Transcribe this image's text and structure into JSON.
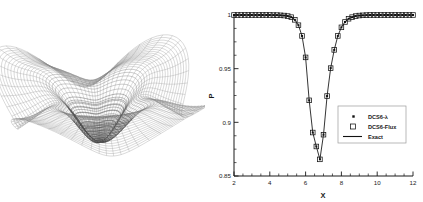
{
  "figure": {
    "panels": [
      "surface-plot",
      "line-plot"
    ]
  },
  "surface_plot": {
    "name": "pressure-surface-wireframe",
    "description": "3D wireframe mesh surface",
    "mesh_color": "#8a8a8a",
    "center_color": "#4a4a4a",
    "radial_lines": 72,
    "circumferential_lines": 34
  },
  "chart_data": {
    "type": "line",
    "title": "",
    "xlabel": "X",
    "ylabel": "P",
    "xlim": [
      2,
      12
    ],
    "ylim": [
      0.85,
      1.0
    ],
    "xticks": [
      "2",
      "4",
      "6",
      "8",
      "10",
      "12"
    ],
    "yticks": [
      "0.85",
      "0.9",
      "0.95",
      "1"
    ],
    "xtick_values": [
      2,
      4,
      6,
      8,
      10,
      12
    ],
    "ytick_values": [
      0.85,
      0.9,
      0.95,
      1.0
    ],
    "grid": false,
    "legend_position": "center-right",
    "legend": [
      {
        "label": "DCS6-λ",
        "marker": "dot"
      },
      {
        "label": "DCS6-Flux",
        "marker": "square"
      },
      {
        "label": "Exact",
        "marker": "line"
      }
    ],
    "series": [
      {
        "name": "Exact",
        "marker": "line",
        "x": [
          2.0,
          2.4,
          2.8,
          3.2,
          3.6,
          4.0,
          4.4,
          4.8,
          5.0,
          5.2,
          5.4,
          5.6,
          5.8,
          6.0,
          6.2,
          6.4,
          6.6,
          6.8,
          7.0,
          7.2,
          7.4,
          7.6,
          7.8,
          8.0,
          8.2,
          8.4,
          8.6,
          8.8,
          9.0,
          9.4,
          9.8,
          10.2,
          10.6,
          11.0,
          11.4,
          11.8,
          12.0
        ],
        "y": [
          1.0,
          1.0,
          1.0,
          1.0,
          1.0,
          1.0,
          0.9999,
          0.9995,
          0.999,
          0.998,
          0.9955,
          0.9905,
          0.9805,
          0.9605,
          0.9205,
          0.8905,
          0.8775,
          0.8655,
          0.8885,
          0.9245,
          0.9505,
          0.9675,
          0.9805,
          0.9885,
          0.9935,
          0.9965,
          0.998,
          0.999,
          0.9995,
          0.9999,
          1.0,
          1.0,
          1.0,
          1.0,
          1.0,
          1.0,
          1.0
        ]
      },
      {
        "name": "DCS6-Flux",
        "marker": "square",
        "x": [
          2.0,
          2.2,
          2.4,
          2.6,
          2.8,
          3.0,
          3.2,
          3.4,
          3.6,
          3.8,
          4.0,
          4.2,
          4.4,
          4.6,
          4.8,
          5.0,
          5.2,
          5.4,
          5.6,
          5.8,
          6.0,
          6.2,
          6.4,
          6.6,
          6.8,
          7.0,
          7.2,
          7.4,
          7.6,
          7.8,
          8.0,
          8.2,
          8.4,
          8.6,
          8.8,
          9.0,
          9.2,
          9.4,
          9.6,
          9.8,
          10.0,
          10.2,
          10.4,
          10.6,
          10.8,
          11.0,
          11.2,
          11.4,
          11.6,
          11.8,
          12.0
        ],
        "y": [
          1.0,
          1.0,
          1.0,
          1.0,
          1.0,
          1.0,
          1.0,
          1.0,
          1.0,
          1.0,
          1.0,
          0.9999,
          0.9999,
          0.9997,
          0.9995,
          0.999,
          0.998,
          0.9955,
          0.9905,
          0.9805,
          0.9605,
          0.9205,
          0.8905,
          0.8775,
          0.8655,
          0.8885,
          0.9245,
          0.9505,
          0.9675,
          0.9805,
          0.9885,
          0.9935,
          0.9965,
          0.998,
          0.999,
          0.9995,
          0.9997,
          0.9999,
          1.0,
          1.0,
          1.0,
          1.0,
          1.0,
          1.0,
          1.0,
          1.0,
          1.0,
          1.0,
          1.0,
          1.0,
          1.0
        ]
      },
      {
        "name": "DCS6-λ",
        "marker": "dot",
        "x": [
          2.0,
          2.2,
          2.4,
          2.6,
          2.8,
          3.0,
          3.2,
          3.4,
          3.6,
          3.8,
          4.0,
          4.2,
          4.4,
          4.6,
          4.8,
          5.0,
          5.2,
          5.4,
          5.6,
          5.8,
          6.0,
          6.2,
          6.4,
          6.6,
          6.8,
          7.0,
          7.2,
          7.4,
          7.6,
          7.8,
          8.0,
          8.2,
          8.4,
          8.6,
          8.8,
          9.0,
          9.2,
          9.4,
          9.6,
          9.8,
          10.0,
          10.2,
          10.4,
          10.6,
          10.8,
          11.0,
          11.2,
          11.4,
          11.6,
          11.8,
          12.0
        ],
        "y": [
          1.0,
          1.0,
          1.0,
          1.0,
          1.0,
          1.0,
          1.0,
          1.0,
          1.0,
          1.0,
          1.0,
          0.9999,
          0.9999,
          0.9997,
          0.9995,
          0.999,
          0.998,
          0.9955,
          0.9905,
          0.9805,
          0.9605,
          0.9205,
          0.8905,
          0.8775,
          0.8655,
          0.8885,
          0.9245,
          0.9505,
          0.9675,
          0.9805,
          0.9885,
          0.9935,
          0.9965,
          0.998,
          0.999,
          0.9995,
          0.9997,
          0.9999,
          1.0,
          1.0,
          1.0,
          1.0,
          1.0,
          1.0,
          1.0,
          1.0,
          1.0,
          1.0,
          1.0,
          1.0,
          1.0
        ]
      }
    ]
  }
}
